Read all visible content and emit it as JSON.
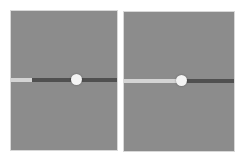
{
  "colors": {
    "panel_bg": "#8c8c8c",
    "track": "#505050",
    "fill": "#d4d4d4",
    "thumb": "#f4f4f4"
  },
  "sliders": [
    {
      "name": "slider-1",
      "fill_percent": 20,
      "thumb_percent": 62
    },
    {
      "name": "slider-2",
      "fill_percent": 52,
      "thumb_percent": 52
    }
  ]
}
